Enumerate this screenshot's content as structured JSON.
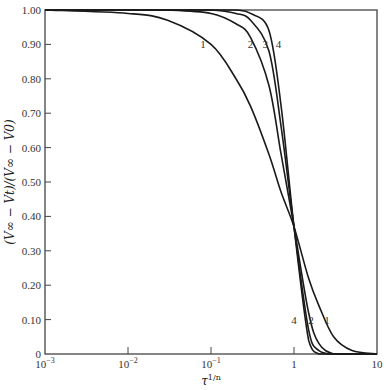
{
  "chart_data": {
    "type": "line",
    "title": "",
    "xlabel": "τ^{1/n}",
    "ylabel": "(V∞ − Vt)/(V∞ − V0)",
    "xscale": "log",
    "xlim": [
      0.001,
      10
    ],
    "ylim": [
      0,
      1.0
    ],
    "grid": false,
    "legend": "inline curve labels",
    "x_ticks": [
      "10^-3",
      "10^-2",
      "10^-1",
      "1",
      "10"
    ],
    "y_ticks": [
      "0",
      "0.10",
      "0.20",
      "0.30",
      "0.40",
      "0.50",
      "0.60",
      "0.70",
      "0.80",
      "0.90",
      "1.00"
    ],
    "x": [
      0.001,
      0.01,
      0.03,
      0.1,
      0.2,
      0.3,
      0.5,
      0.7,
      1.0,
      1.5,
      2,
      3,
      5,
      10
    ],
    "series": [
      {
        "name": "1",
        "values": [
          1.0,
          0.99,
          0.97,
          0.9,
          0.8,
          0.72,
          0.58,
          0.47,
          0.37,
          0.22,
          0.14,
          0.05,
          0.01,
          0.0
        ]
      },
      {
        "name": "2",
        "values": [
          1.0,
          1.0,
          1.0,
          0.99,
          0.96,
          0.92,
          0.78,
          0.58,
          0.37,
          0.12,
          0.03,
          0.0,
          0.0,
          0.0
        ]
      },
      {
        "name": "3",
        "values": [
          1.0,
          1.0,
          1.0,
          1.0,
          0.99,
          0.97,
          0.88,
          0.66,
          0.37,
          0.07,
          0.01,
          0.0,
          0.0,
          0.0
        ]
      },
      {
        "name": "4",
        "values": [
          1.0,
          1.0,
          1.0,
          1.0,
          1.0,
          0.99,
          0.94,
          0.72,
          0.37,
          0.04,
          0.0,
          0.0,
          0.0,
          0.0
        ]
      }
    ],
    "annotations": [
      {
        "text": "1",
        "x": 0.08,
        "y": 0.9
      },
      {
        "text": "2",
        "x": 0.3,
        "y": 0.9
      },
      {
        "text": "3",
        "x": 0.45,
        "y": 0.9
      },
      {
        "text": "4",
        "x": 0.65,
        "y": 0.9
      },
      {
        "text": "4",
        "x": 1.0,
        "y": 0.1
      },
      {
        "text": "2",
        "x": 1.6,
        "y": 0.1
      },
      {
        "text": "1",
        "x": 2.5,
        "y": 0.1
      }
    ]
  },
  "axes": {
    "xlabel_base": "τ",
    "xlabel_sup": "1/n",
    "ylabel": "(V∞ − Vt)/(V∞ − V0)"
  }
}
